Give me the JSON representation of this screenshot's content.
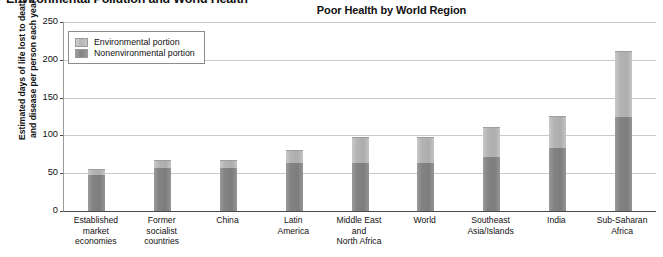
{
  "page": {
    "header": "Environmental Pollution and World Health"
  },
  "chart": {
    "title": "Poor Health by World Region",
    "y_axis_title_line1": "Estimated days of life lost to death",
    "y_axis_title_line2": "and disease per person each year",
    "legend": [
      {
        "label": "Environmental portion",
        "color": "#b6b6b6",
        "key": "environmental"
      },
      {
        "label": "Nonenvironmental portion",
        "color": "#848484",
        "key": "nonenvironmental"
      }
    ]
  },
  "chart_data": {
    "type": "bar",
    "subtype": "stacked",
    "title": "Poor Health by World Region",
    "xlabel": "",
    "ylabel": "Estimated days of life lost to death and disease per person each year",
    "ylim": [
      0,
      250
    ],
    "yticks": [
      0,
      50,
      100,
      150,
      200,
      250
    ],
    "grid": true,
    "legend_position": "upper-left-inside",
    "categories": [
      "Established market economies",
      "Former socialist countries",
      "China",
      "Latin America",
      "Middle East and North Africa",
      "World",
      "Southeast Asia/Islands",
      "India",
      "Sub-Saharan Africa"
    ],
    "category_label_lines": [
      [
        "Established",
        "market",
        "economies"
      ],
      [
        "Former",
        "socialist",
        "countries"
      ],
      [
        "China"
      ],
      [
        "Latin",
        "America"
      ],
      [
        "Middle East",
        "and",
        "North Africa"
      ],
      [
        "World"
      ],
      [
        "Southeast",
        "Asia/Islands"
      ],
      [
        "India"
      ],
      [
        "Sub-Saharan",
        "Africa"
      ]
    ],
    "series": [
      {
        "name": "Nonenvironmental portion",
        "color": "#848484",
        "values": [
          48,
          57,
          57,
          64,
          64,
          64,
          72,
          83,
          124
        ]
      },
      {
        "name": "Environmental portion",
        "color": "#b6b6b6",
        "values": [
          8,
          11,
          11,
          17,
          34,
          34,
          39,
          43,
          88
        ]
      }
    ],
    "totals": [
      56,
      68,
      68,
      81,
      98,
      98,
      111,
      126,
      212
    ]
  }
}
